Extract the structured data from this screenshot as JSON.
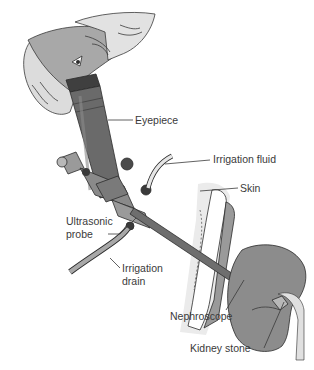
{
  "diagram": {
    "type": "medical-illustration",
    "labels": {
      "eyepiece": "Eyepiece",
      "irrigation_fluid": "Irrigation fluid",
      "skin": "Skin",
      "ultrasonic_probe_line1": "Ultrasonic",
      "ultrasonic_probe_line2": "probe",
      "irrigation_drain_line1": "Irrigation",
      "irrigation_drain_line2": "drain",
      "nephroscope": "Nephroscope",
      "kidney_stone": "Kidney stone"
    },
    "colors": {
      "cap": "#d9d9d9",
      "cap_band": "#a8a8a8",
      "scope_dark": "#5a5a5a",
      "scope_mid": "#7a7a7a",
      "kidney": "#8c8c8c",
      "skin_light": "#e6e6e6",
      "tissue": "#c8c8c8",
      "muscle": "#9a9a9a",
      "line": "#2b2b2b"
    }
  }
}
